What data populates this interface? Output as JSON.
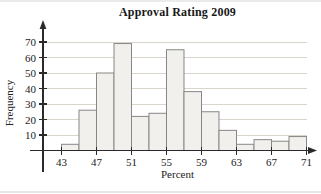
{
  "page": {
    "background": "#ffffff"
  },
  "chart_data": {
    "type": "bar",
    "subtype": "histogram",
    "title": "Approval Rating 2009",
    "xlabel": "Percent",
    "ylabel": "Frequency",
    "bin_width": 2,
    "bin_edges": [
      43,
      45,
      47,
      49,
      51,
      53,
      55,
      57,
      59,
      61,
      63,
      65,
      67,
      69,
      71
    ],
    "categories": [
      "43-45",
      "45-47",
      "47-49",
      "49-51",
      "51-53",
      "53-55",
      "55-57",
      "57-59",
      "59-61",
      "61-63",
      "63-65",
      "65-67",
      "67-69",
      "69-71"
    ],
    "values": [
      4,
      26,
      50,
      69,
      22,
      24,
      65,
      38,
      25,
      13,
      4,
      7,
      6,
      9
    ],
    "x_ticks": [
      43,
      47,
      51,
      55,
      59,
      63,
      67,
      71
    ],
    "y_ticks": [
      10,
      20,
      30,
      40,
      50,
      60,
      70
    ],
    "xlim": [
      43,
      71
    ],
    "ylim": [
      0,
      75
    ],
    "grid": "horizontal",
    "legend": "none",
    "colors": {
      "bar_fill": "#f1f0ed",
      "bar_stroke": "#878787",
      "grid_line": "#d9d5cb",
      "axis_line": "#2a2a2a",
      "tick_text": "#1b1b1b"
    }
  }
}
